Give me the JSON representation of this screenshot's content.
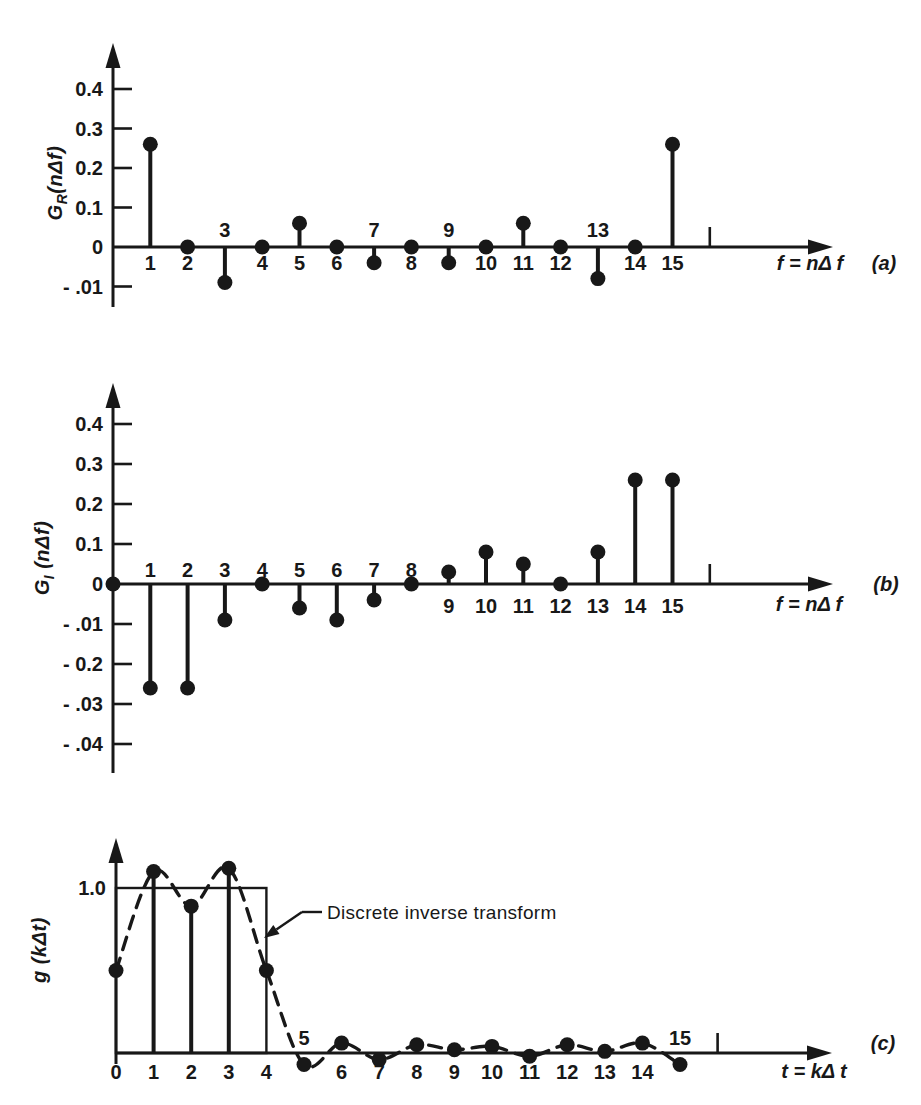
{
  "figure": {
    "background": "#ffffff",
    "ink": "#181818",
    "description_visible_panels": [
      "(a)",
      "(b)",
      "(c)"
    ]
  },
  "chart_data": [
    {
      "type": "stem",
      "panel_label": "(a)",
      "ylabel": {
        "base": "G",
        "sub": "R",
        "rest": "(nΔf)"
      },
      "xlabel": "f = nΔ f",
      "ylim": [
        -0.15,
        0.5
      ],
      "xlim": [
        0,
        19.3
      ],
      "grid": false,
      "yticks": [
        {
          "label": "0.4",
          "value": 0.4
        },
        {
          "label": "0.3",
          "value": 0.3
        },
        {
          "label": "0.2",
          "value": 0.2
        },
        {
          "label": "0.1",
          "value": 0.1
        },
        {
          "label": "0",
          "value": 0
        },
        {
          "label": "- .01",
          "value": -0.1
        }
      ],
      "points": [
        {
          "x": 1,
          "v": 0.26,
          "label": "1"
        },
        {
          "x": 2,
          "v": 0,
          "label": "2"
        },
        {
          "x": 3,
          "v": -0.09,
          "label": "3"
        },
        {
          "x": 4,
          "v": 0,
          "label": "4"
        },
        {
          "x": 5,
          "v": 0.06,
          "label": "5"
        },
        {
          "x": 6,
          "v": 0,
          "label": "6"
        },
        {
          "x": 7,
          "v": -0.04,
          "label": "7"
        },
        {
          "x": 8,
          "v": 0,
          "label": "8"
        },
        {
          "x": 9,
          "v": -0.04,
          "label": "9"
        },
        {
          "x": 10,
          "v": 0,
          "label": "10"
        },
        {
          "x": 11,
          "v": 0.06,
          "label": "11"
        },
        {
          "x": 12,
          "v": 0,
          "label": "12"
        },
        {
          "x": 13,
          "v": -0.08,
          "label": "13"
        },
        {
          "x": 14,
          "v": 0,
          "label": "14"
        },
        {
          "x": 15,
          "v": 0.26,
          "label": "15"
        }
      ],
      "label_above": [
        3,
        7,
        9,
        13
      ],
      "extra_tick_x": 16
    },
    {
      "type": "stem",
      "panel_label": "(b)",
      "ylabel": {
        "base": "G",
        "sub": "I",
        "rest": " (nΔf)"
      },
      "xlabel": "f = nΔ f",
      "ylim": [
        -0.45,
        0.5
      ],
      "xlim": [
        0,
        19.3
      ],
      "grid": false,
      "yticks": [
        {
          "label": "0.4",
          "value": 0.4
        },
        {
          "label": "0.3",
          "value": 0.3
        },
        {
          "label": "0.2",
          "value": 0.2
        },
        {
          "label": "0.1",
          "value": 0.1
        },
        {
          "label": "0",
          "value": 0
        },
        {
          "label": "- .01",
          "value": -0.1
        },
        {
          "label": "- 0.2",
          "value": -0.2
        },
        {
          "label": "- .03",
          "value": -0.3
        },
        {
          "label": "- .04",
          "value": -0.4
        }
      ],
      "points": [
        {
          "x": 0,
          "v": 0,
          "label": ""
        },
        {
          "x": 1,
          "v": -0.26,
          "label": "1"
        },
        {
          "x": 2,
          "v": -0.26,
          "label": "2"
        },
        {
          "x": 3,
          "v": -0.09,
          "label": "3"
        },
        {
          "x": 4,
          "v": 0,
          "label": "4"
        },
        {
          "x": 5,
          "v": -0.06,
          "label": "5"
        },
        {
          "x": 6,
          "v": -0.09,
          "label": "6"
        },
        {
          "x": 7,
          "v": -0.04,
          "label": "7"
        },
        {
          "x": 8,
          "v": 0,
          "label": "8"
        },
        {
          "x": 9,
          "v": 0.03,
          "label": "9"
        },
        {
          "x": 10,
          "v": 0.08,
          "label": "10"
        },
        {
          "x": 11,
          "v": 0.05,
          "label": "11"
        },
        {
          "x": 12,
          "v": 0,
          "label": "12"
        },
        {
          "x": 13,
          "v": 0.08,
          "label": "13"
        },
        {
          "x": 14,
          "v": 0.26,
          "label": "14"
        },
        {
          "x": 15,
          "v": 0.26,
          "label": "15"
        }
      ],
      "label_above": [
        1,
        2,
        3,
        4,
        5,
        6,
        7,
        8
      ],
      "extra_tick_x": 16
    },
    {
      "type": "stem+line",
      "panel_label": "(c)",
      "ylabel": {
        "base": "g",
        "sub": "",
        "rest": " (kΔt)"
      },
      "xlabel": "t = kΔ t",
      "ylim": [
        -0.12,
        1.3
      ],
      "xlim": [
        0,
        19.2
      ],
      "grid": false,
      "curve": "dashed",
      "yticks": [
        {
          "label": "1.0",
          "value": 1.0
        }
      ],
      "points": [
        {
          "x": 0,
          "v": 0.5,
          "label": "0"
        },
        {
          "x": 1,
          "v": 1.1,
          "label": "1"
        },
        {
          "x": 2,
          "v": 0.89,
          "label": "2"
        },
        {
          "x": 3,
          "v": 1.12,
          "label": "3"
        },
        {
          "x": 4,
          "v": 0.5,
          "label": "4"
        },
        {
          "x": 5,
          "v": -0.07,
          "label": "5"
        },
        {
          "x": 6,
          "v": 0.06,
          "label": "6"
        },
        {
          "x": 7,
          "v": -0.04,
          "label": "7"
        },
        {
          "x": 8,
          "v": 0.05,
          "label": "8"
        },
        {
          "x": 9,
          "v": 0.02,
          "label": "9"
        },
        {
          "x": 10,
          "v": 0.04,
          "label": "10"
        },
        {
          "x": 11,
          "v": -0.02,
          "label": "11"
        },
        {
          "x": 12,
          "v": 0.05,
          "label": "12"
        },
        {
          "x": 13,
          "v": 0.01,
          "label": "13"
        },
        {
          "x": 14,
          "v": 0.06,
          "label": "14"
        },
        {
          "x": 15,
          "v": -0.07,
          "label": "15"
        }
      ],
      "stems_at": [
        1,
        2,
        3
      ],
      "label_above": [
        5,
        15
      ],
      "pulse": {
        "x0": 0,
        "x1": 4,
        "height": 1.0
      },
      "annotation": {
        "text": "Discrete inverse transform"
      },
      "extra_tick_x": 16
    }
  ]
}
